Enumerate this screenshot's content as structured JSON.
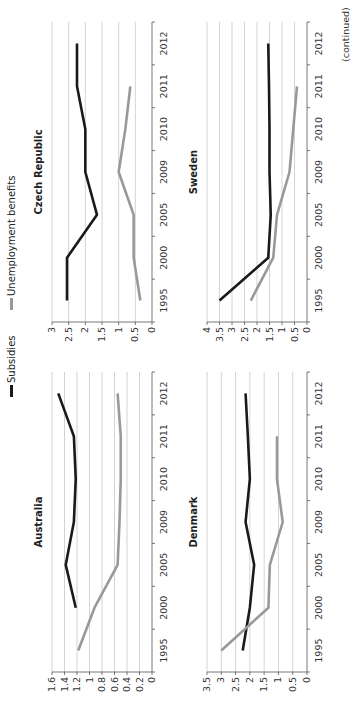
{
  "legend": {
    "subsidies_label": "Subsidies",
    "unemployment_label": "Unemployment benefits"
  },
  "footer": {
    "continued": "(continued)"
  },
  "colors": {
    "subsidies": "#1a1a1a",
    "unemployment": "#999999",
    "grid": "#c8c8c8",
    "axis": "#555555"
  },
  "chart_data": [
    {
      "type": "line",
      "title": "Australia",
      "categories": [
        "1995",
        "2000",
        "2005",
        "2009",
        "2010",
        "2011",
        "2012"
      ],
      "yticks": [
        "0",
        "0.2",
        "0.4",
        "0.6",
        "0.8",
        "1",
        "1.2",
        "1.4",
        "1.6"
      ],
      "ylim": [
        0,
        1.6
      ],
      "grid": true,
      "series": [
        {
          "name": "Subsidies",
          "values": [
            null,
            1.22,
            1.38,
            1.25,
            1.22,
            1.25,
            1.5
          ]
        },
        {
          "name": "Unemployment benefits",
          "values": [
            1.18,
            0.92,
            0.55,
            0.52,
            0.5,
            0.5,
            0.55
          ]
        }
      ]
    },
    {
      "type": "line",
      "title": "Czech Republic",
      "categories": [
        "1995",
        "2000",
        "2005",
        "2009",
        "2010",
        "2011",
        "2012"
      ],
      "yticks": [
        "0",
        "0.5",
        "1",
        "1.5",
        "2",
        "2.5",
        "3"
      ],
      "ylim": [
        0,
        3
      ],
      "grid": true,
      "series": [
        {
          "name": "Subsidies",
          "values": [
            2.55,
            2.55,
            1.65,
            2.0,
            2.0,
            2.25,
            2.25
          ]
        },
        {
          "name": "Unemployment benefits",
          "values": [
            0.35,
            0.55,
            0.55,
            1.0,
            0.8,
            0.65,
            null
          ]
        }
      ]
    },
    {
      "type": "line",
      "title": "Denmark",
      "categories": [
        "1995",
        "2000",
        "2005",
        "2009",
        "2010",
        "2011",
        "2012"
      ],
      "yticks": [
        "0",
        "0.5",
        "1",
        "1.5",
        "2",
        "2.5",
        "3",
        "3.5"
      ],
      "ylim": [
        0,
        3.5
      ],
      "grid": true,
      "series": [
        {
          "name": "Subsidies",
          "values": [
            2.25,
            2.0,
            1.85,
            2.15,
            2.0,
            2.07,
            2.15
          ]
        },
        {
          "name": "Unemployment benefits",
          "values": [
            3.0,
            1.35,
            1.3,
            0.85,
            1.05,
            1.05,
            null
          ]
        }
      ]
    },
    {
      "type": "line",
      "title": "Sweden",
      "categories": [
        "1995",
        "2000",
        "2005",
        "2009",
        "2010",
        "2011",
        "2012"
      ],
      "yticks": [
        "0",
        "0.5",
        "1",
        "1.5",
        "2",
        "2.5",
        "3",
        "3.5",
        "4"
      ],
      "ylim": [
        0,
        4
      ],
      "grid": true,
      "series": [
        {
          "name": "Subsidies",
          "values": [
            3.5,
            1.55,
            1.45,
            1.5,
            1.5,
            1.52,
            1.55
          ]
        },
        {
          "name": "Unemployment benefits",
          "values": [
            2.25,
            1.35,
            1.2,
            0.7,
            0.55,
            0.4,
            null
          ]
        }
      ]
    }
  ]
}
